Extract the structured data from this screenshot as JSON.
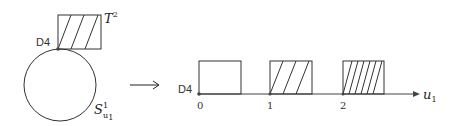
{
  "left": {
    "point_label": "D4",
    "torus_label": "T",
    "torus_sup": "2",
    "circle_label": "S",
    "circle_sup": "1",
    "circle_sub": "u",
    "circle_subsub": "1"
  },
  "arrow": "⟶",
  "right": {
    "point_label": "D4",
    "axis_label": "u",
    "axis_sub": "1",
    "ticks": [
      "0",
      "1",
      "2"
    ],
    "boxes": [
      {
        "hatch_lines": 0
      },
      {
        "hatch_lines": 3
      },
      {
        "hatch_lines": 6
      }
    ]
  }
}
